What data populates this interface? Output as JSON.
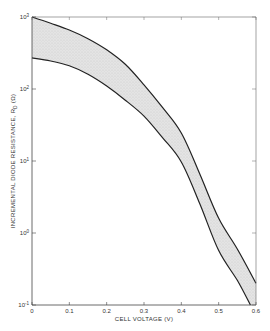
{
  "chart_data": {
    "type": "area",
    "title": "",
    "xlabel": "CELL VOLTAGE (V)",
    "ylabel": "INCREMENTAL DIODE RESISTANCE, R_D (Ω)",
    "ylabel_main": "INCREMENTAL DIODE RESISTANCE, R",
    "ylabel_sub": "D",
    "ylabel_unit": " (Ω)",
    "xlim": [
      0,
      0.6
    ],
    "ylim": [
      0.1,
      1000
    ],
    "yscale": "log",
    "grid": false,
    "legend": null,
    "x_ticks": [
      "0",
      "0.1",
      "0.2",
      "0.3",
      "0.4",
      "0.5",
      "0.6"
    ],
    "x_tick_values": [
      0,
      0.1,
      0.2,
      0.3,
      0.4,
      0.5,
      0.6
    ],
    "y_ticks": [
      {
        "base": "10",
        "exp": "3",
        "value": 1000
      },
      {
        "base": "10",
        "exp": "2",
        "value": 100
      },
      {
        "base": "10",
        "exp": "1",
        "value": 10
      },
      {
        "base": "10",
        "exp": "0",
        "value": 1
      },
      {
        "base": "10",
        "exp": "-1",
        "value": 0.1
      }
    ],
    "series": [
      {
        "name": "Upper bound",
        "x": [
          0,
          0.05,
          0.1,
          0.15,
          0.2,
          0.25,
          0.3,
          0.35,
          0.4,
          0.45,
          0.5,
          0.55,
          0.6
        ],
        "values": [
          1000,
          820,
          660,
          500,
          350,
          220,
          114,
          55,
          24.5,
          6.5,
          1.6,
          0.6,
          0.2
        ]
      },
      {
        "name": "Lower bound",
        "x": [
          0,
          0.05,
          0.1,
          0.15,
          0.2,
          0.25,
          0.3,
          0.35,
          0.4,
          0.45,
          0.5,
          0.55,
          0.585
        ],
        "values": [
          270,
          245,
          210,
          160,
          110,
          70,
          42,
          21,
          9.7,
          2.5,
          0.57,
          0.22,
          0.1
        ]
      }
    ],
    "fill_between": {
      "series": [
        "Upper bound",
        "Lower bound"
      ],
      "color": "#d4d4d4"
    },
    "line_color": "#222222"
  }
}
